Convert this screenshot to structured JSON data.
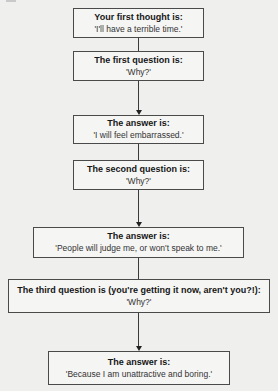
{
  "flowchart": {
    "nodes": [
      {
        "id": "first-thought",
        "head": "Your first thought is:",
        "body": "'I'll have a terrible time.'"
      },
      {
        "id": "first-question",
        "head": "The first question is:",
        "body": "'Why?'"
      },
      {
        "id": "first-answer",
        "head": "The answer is:",
        "body": "'I will feel embarrassed.'"
      },
      {
        "id": "second-question",
        "head": "The second question is:",
        "body": "'Why?'"
      },
      {
        "id": "second-answer",
        "head": "The answer is:",
        "body": "'People will judge me, or won't speak to me.'"
      },
      {
        "id": "third-question",
        "head": "The third question is (you're getting it now, aren't you?!):",
        "body": "'Why?'"
      },
      {
        "id": "third-answer",
        "head": "The answer is:",
        "body": "'Because I am unattractive and boring.'"
      }
    ],
    "edges": [
      {
        "from": "first-thought",
        "to": "first-question",
        "arrow": false
      },
      {
        "from": "first-question",
        "to": "first-answer",
        "arrow": true
      },
      {
        "from": "first-answer",
        "to": "second-question",
        "arrow": false
      },
      {
        "from": "second-question",
        "to": "second-answer",
        "arrow": true
      },
      {
        "from": "second-answer",
        "to": "third-question",
        "arrow": false
      },
      {
        "from": "third-question",
        "to": "third-answer",
        "arrow": true
      }
    ]
  }
}
